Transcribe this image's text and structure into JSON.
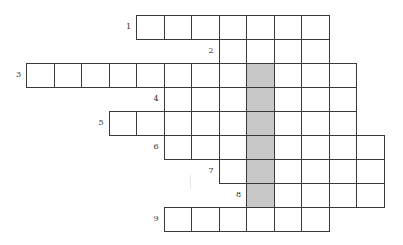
{
  "puzzle": {
    "type": "crossword",
    "grid": {
      "origin_x": 26,
      "origin_y": 15,
      "cell_width": 27.5,
      "cell_height": 24,
      "border_color": "#3a3a3a",
      "shade_color": "#c8c8c8"
    },
    "rows": [
      {
        "number": "1",
        "start_col": 4,
        "length": 7,
        "row": 0
      },
      {
        "number": "2",
        "start_col": 7,
        "length": 4,
        "row": 1
      },
      {
        "number": "3",
        "start_col": 0,
        "length": 12,
        "row": 2
      },
      {
        "number": "4",
        "start_col": 5,
        "length": 7,
        "row": 3
      },
      {
        "number": "5",
        "start_col": 3,
        "length": 9,
        "row": 4
      },
      {
        "number": "6",
        "start_col": 5,
        "length": 8,
        "row": 5
      },
      {
        "number": "7",
        "start_col": 7,
        "length": 6,
        "row": 6
      },
      {
        "number": "8",
        "start_col": 8,
        "length": 5,
        "row": 7
      },
      {
        "number": "9",
        "start_col": 5,
        "length": 6,
        "row": 8
      }
    ],
    "shaded_column": {
      "col": 8,
      "from_row": 2,
      "to_row": 7
    }
  }
}
